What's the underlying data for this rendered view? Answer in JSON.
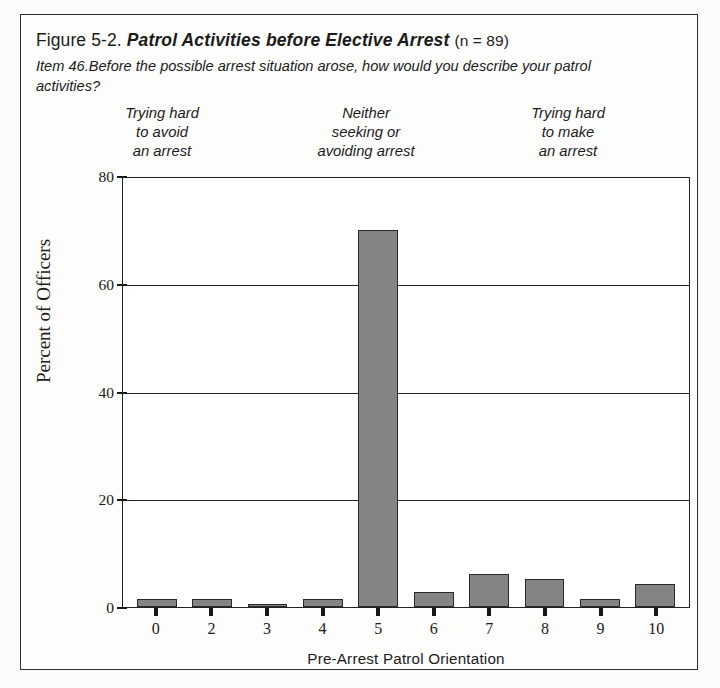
{
  "figure": {
    "number": "Figure 5-2.",
    "title": "Patrol Activities before Elective Arrest",
    "sample": "(n = 89)",
    "item_label": "Item 46.",
    "question": "Before the possible arrest situation arose, how would you describe your patrol activities?",
    "anchors": {
      "left": "Trying hard\nto avoid\nan arrest",
      "middle": "Neither\nseeking or\navoiding arrest",
      "right": "Trying hard\nto make\nan arrest"
    }
  },
  "colors": {
    "bar_fill": "#848484",
    "bar_border": "#2a2a2a",
    "axis": "#232323",
    "page_background": "#fdfdfb"
  },
  "chart_data": {
    "type": "bar",
    "title": "Patrol Activities before Elective Arrest",
    "categories": [
      "0",
      "2",
      "3",
      "4",
      "5",
      "6",
      "7",
      "8",
      "9",
      "10"
    ],
    "values": [
      1.5,
      1.5,
      0.5,
      1.5,
      70,
      2.8,
      6.2,
      5.2,
      1.5,
      4.2
    ],
    "xlabel": "Pre-Arrest Patrol Orientation",
    "ylabel": "Percent of Officers",
    "ylim": [
      0,
      80
    ],
    "yticks": [
      0,
      20,
      40,
      60,
      80
    ],
    "ytick_labels": [
      "0",
      "20",
      "40",
      "60",
      "80"
    ],
    "grid": true,
    "legend": "none"
  }
}
